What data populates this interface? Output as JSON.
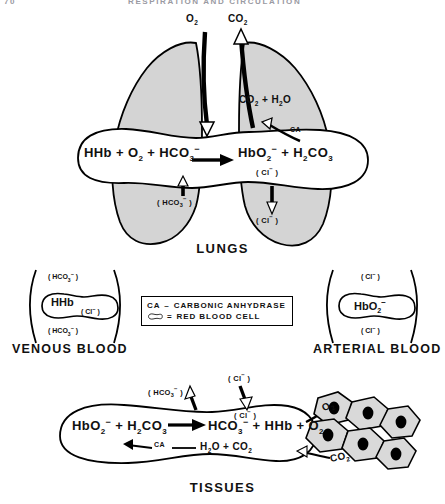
{
  "header": {
    "page_number": "70",
    "running_title": "RESPIRATION AND CIRCULATION"
  },
  "lungs": {
    "title": "LUNGS",
    "gas_in": "O2",
    "gas_out": "CO2",
    "inner_gas": "CO2 + H2O",
    "enzyme": "CA",
    "equation": {
      "left": [
        "HHb",
        "+",
        "O2",
        "+",
        "HCO3-"
      ],
      "arrow": "right",
      "right": [
        "HbO2-",
        "+",
        "H2CO3"
      ]
    },
    "ion_in": "(HCO3-)",
    "ion_out": "(Cl-)",
    "ion_out_inner": "(Cl-)"
  },
  "venous": {
    "label": "VENOUS BLOOD",
    "ion_top": "(HCO3-)",
    "cell_main": "HHb",
    "cell_sub": "(Cl-)",
    "ion_bottom": "(HCO3-)"
  },
  "arterial": {
    "label": "ARTERIAL BLOOD",
    "ion_top": "(Cl-)",
    "cell_main": "HbO2-",
    "ion_bottom": "(Cl-)"
  },
  "legend": {
    "enzyme_abbr": "CA",
    "enzyme_dash": "–",
    "enzyme_name": "CARBONIC ANHYDRASE",
    "rbc_equals": "=",
    "rbc_name": "RED BLOOD CELL"
  },
  "tissues": {
    "title": "TISSUES",
    "equation": {
      "left": [
        "HbO2-",
        "+",
        "H2CO3"
      ],
      "arrow": "right",
      "right": [
        "HCO3-",
        "+",
        "HHb",
        "+",
        "O2"
      ]
    },
    "enzyme": "CA",
    "reverse_products": "H2O + CO2",
    "ion_out": "(HCO3-)",
    "ion_in_outer": "(Cl-)",
    "ion_in_inner": "(Cl-)",
    "cell_gas_in": "O2",
    "cell_gas_out": "CO2",
    "cell_count": 6
  },
  "colors": {
    "ink": "#000000",
    "lung_fill": "#d4d4d4",
    "tissue_fill": "#d9d9d9",
    "paper": "#ffffff",
    "header_text": "#9a9aa2"
  }
}
